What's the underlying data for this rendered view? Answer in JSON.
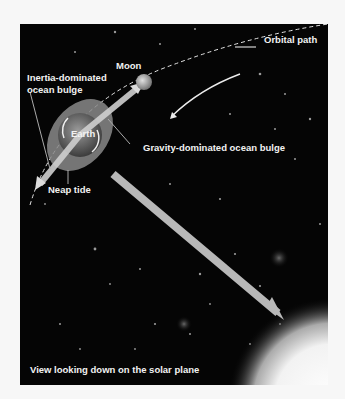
{
  "figure": {
    "labels": {
      "orbital_path": "Orbital path",
      "moon": "Moon",
      "inertia_line1": "Inertia-dominated",
      "inertia_line2": "ocean bulge",
      "earth": "Earth",
      "gravity": "Gravity-dominated ocean bulge",
      "neap_tide": "Neap tide",
      "caption": "View looking down on the solar plane"
    },
    "colors": {
      "background": "#050505",
      "page": "#f7f7f7",
      "label": "#f2f2f2",
      "arrow": "#bdbdbd",
      "bulge": "#8a8a8a",
      "earth": "#5a5a5a",
      "sun": "#ffffff"
    }
  }
}
